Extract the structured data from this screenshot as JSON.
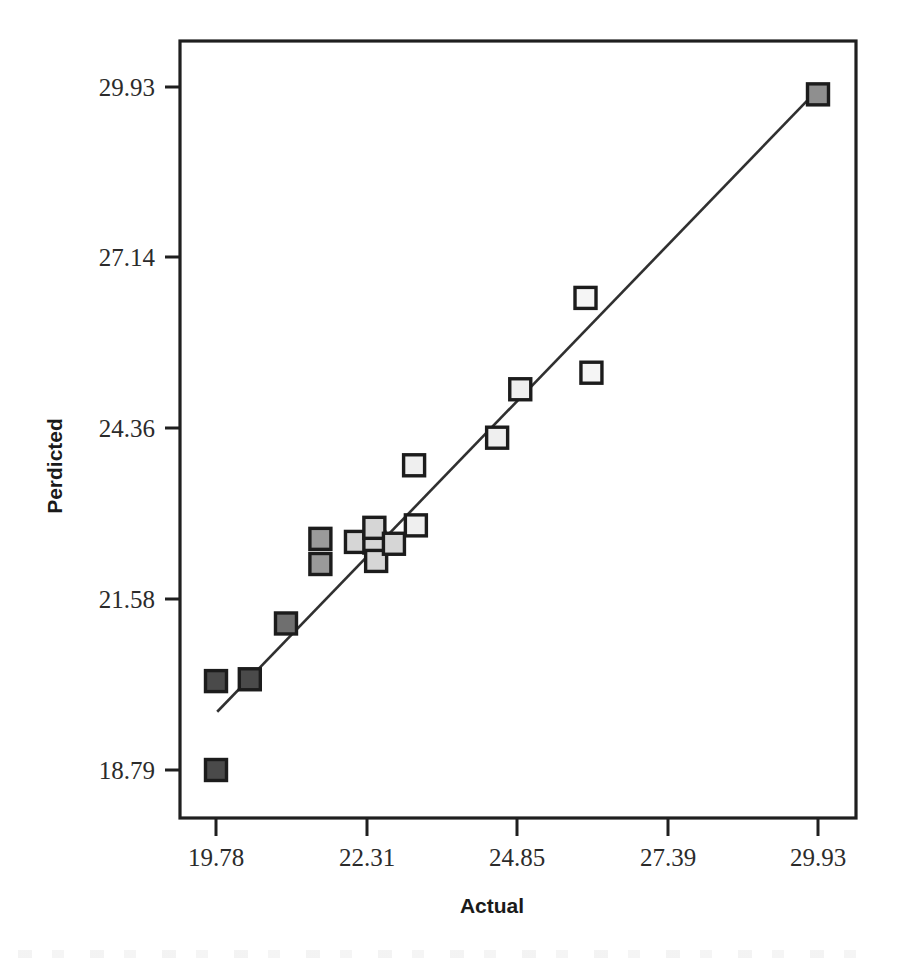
{
  "chart_data": {
    "type": "scatter",
    "title": "",
    "xlabel": "Actual",
    "ylabel": "Perdicted",
    "xlim": [
      19.12,
      30.61
    ],
    "ylim": [
      18.22,
      30.68
    ],
    "grid": false,
    "legend": "none",
    "xticks": [
      "19.78",
      "22.31",
      "24.85",
      "27.39",
      "29.93"
    ],
    "xtick_values": [
      19.78,
      22.31,
      24.85,
      27.39,
      29.93
    ],
    "yticks": [
      "18.79",
      "21.58",
      "24.36",
      "27.14",
      "29.93"
    ],
    "ytick_values": [
      18.79,
      21.58,
      24.36,
      27.14,
      29.93
    ],
    "series": [
      {
        "name": "Predicted vs Actual",
        "marker": "square",
        "points": [
          {
            "x": 19.78,
            "y": 18.79,
            "fill": "#4a4a4a"
          },
          {
            "x": 19.78,
            "y": 20.24,
            "fill": "#4a4a4a"
          },
          {
            "x": 20.35,
            "y": 20.27,
            "fill": "#4a4a4a"
          },
          {
            "x": 20.96,
            "y": 21.18,
            "fill": "#6f6f6f"
          },
          {
            "x": 21.54,
            "y": 22.56,
            "fill": "#9a9a9a"
          },
          {
            "x": 21.54,
            "y": 22.15,
            "fill": "#9a9a9a"
          },
          {
            "x": 22.14,
            "y": 22.51,
            "fill": "#d6d6d6"
          },
          {
            "x": 22.45,
            "y": 22.5,
            "fill": "#d6d6d6"
          },
          {
            "x": 22.45,
            "y": 22.74,
            "fill": "#d6d6d6"
          },
          {
            "x": 22.48,
            "y": 22.2,
            "fill": "#d6d6d6"
          },
          {
            "x": 22.78,
            "y": 22.48,
            "fill": "#d6d6d6"
          },
          {
            "x": 23.15,
            "y": 22.78,
            "fill": "#efefef"
          },
          {
            "x": 23.12,
            "y": 23.76,
            "fill": "#efefef"
          },
          {
            "x": 24.52,
            "y": 24.21,
            "fill": "#efefef"
          },
          {
            "x": 24.91,
            "y": 25.0,
            "fill": "#efefef"
          },
          {
            "x": 26.01,
            "y": 26.49,
            "fill": "#f5f5f5"
          },
          {
            "x": 26.11,
            "y": 25.27,
            "fill": "#f5f5f5"
          },
          {
            "x": 29.93,
            "y": 29.81,
            "fill": "#8f8f8f"
          }
        ]
      }
    ],
    "fit_line": {
      "name": "regression-line",
      "x_start": 19.8,
      "y_start": 19.74,
      "x_end": 30.0,
      "y_end": 29.96
    }
  },
  "axes": {
    "x_title": "Actual",
    "y_title": "Perdicted"
  }
}
